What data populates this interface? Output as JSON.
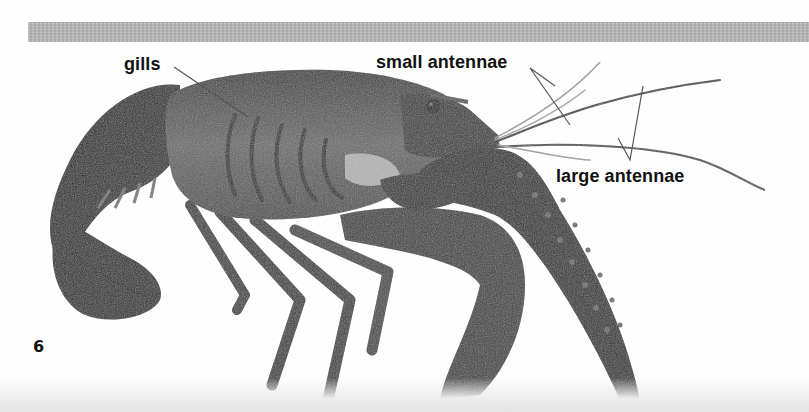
{
  "page": {
    "type": "scanned book page",
    "number": "6",
    "colors": {
      "background": "#fefefe",
      "header_band": "#b9b9b9",
      "label_text": "#111111",
      "leader_line": "#555555"
    }
  },
  "figure": {
    "labels": [
      {
        "id": "gills",
        "text": "gills"
      },
      {
        "id": "small-antennae",
        "text": "small antennae"
      },
      {
        "id": "large-antennae",
        "text": "large antennae"
      }
    ]
  }
}
